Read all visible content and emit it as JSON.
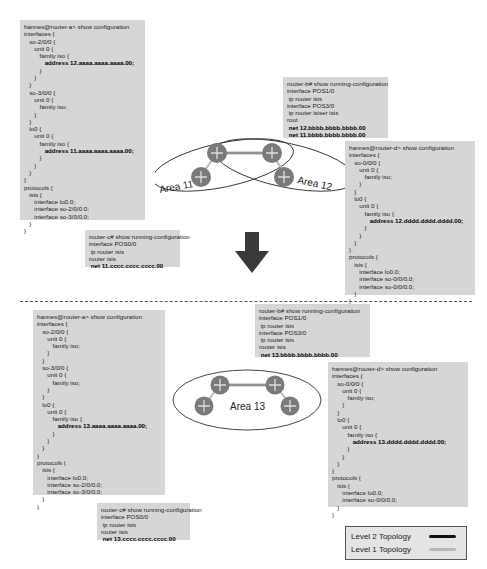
{
  "before": {
    "router_a": {
      "lines": [
        "hannes@router-a> show configuration",
        "interfaces {",
        "   so-2/0/0 {",
        "      unit 0 {",
        "         family iso {",
        "            address 12.aaaa.aaaa.aaaa.00;",
        "         }",
        "      }",
        "   }",
        "   so-3/0/0 {",
        "      unit 0 {",
        "         family iso;",
        "      }",
        "   }",
        "   lo0 {",
        "      unit 0 {",
        "         family iso {",
        "            address 11.aaaa.aaaa.aaaa.00;",
        "         }",
        "      }",
        "   }",
        "}",
        "protocols {",
        "   isis {",
        "      interface lo0.0;",
        "      interface so-2/0/0.0;",
        "      interface so-3/0/0.0;",
        "   }",
        "}"
      ],
      "bold_lines": [
        5,
        17
      ]
    },
    "router_b": {
      "lines": [
        "router-b# show running-configuration",
        "interface POS1/0",
        " ip router isis",
        "interface POS3/0",
        " ip router isiser isis",
        "rout",
        " net 12.bbbb.bbbb.bbbb.00",
        " net 11.bbbb.bbbb.bbbb.00"
      ],
      "bold_lines": [
        6,
        7
      ]
    },
    "router_c": {
      "lines": [
        "router-c# show running-configuration",
        "interface POS0/0",
        " ip router isis",
        "router isis",
        " net 11.cccc.cccc.cccc.00"
      ],
      "bold_lines": [
        4
      ]
    },
    "router_d": {
      "lines": [
        "hannes@router-d> show configuration",
        "interfaces {",
        "   so-0/0/0 {",
        "      unit 0 {",
        "         family iso;",
        "      }",
        "   }",
        "   lo0 {",
        "      unit 0 {",
        "         family iso {",
        "            address 12.dddd.dddd.dddd.00;",
        "         }",
        "      }",
        "   }",
        "}",
        "protocols {",
        "   isis {",
        "      interface lo0.0;",
        "      interface so-0/0/0.0;",
        "      interface so-0/0/0.0;",
        "   }",
        "}"
      ],
      "bold_lines": [
        10
      ]
    },
    "topology": {
      "area_left": "Area 11",
      "area_right": "Area 12"
    }
  },
  "after": {
    "router_a": {
      "lines": [
        "hannes@router-a> show configuration",
        "interfaces {",
        "   so-2/0/0 {",
        "      unit 0 {",
        "         family iso;",
        "      }",
        "   }",
        "   so-3/0/0 {",
        "      unit 0 {",
        "         family iso;",
        "      }",
        "   }",
        "   lo0 {",
        "      unit 0 {",
        "         family iso {",
        "            address 13.aaaa.aaaa.aaaa.00;",
        "         }",
        "      }",
        "   }",
        "}",
        "protocols {",
        "   isis {",
        "      interface lo0.0;",
        "      interface so-2/0/0.0;",
        "      interface so-3/0/0.0;",
        "   }",
        "}"
      ],
      "bold_lines": [
        15
      ]
    },
    "router_b": {
      "lines": [
        "router-b# show running-configuration",
        "interface POS1/0",
        " ip router isis",
        "interface POS3/0",
        " ip router isis",
        "router isis",
        " net 13.bbbb.bbbb.bbbb.00"
      ],
      "bold_lines": [
        6
      ]
    },
    "router_c": {
      "lines": [
        "router-c# show running-configuration",
        "interface POS0/0",
        " ip router isis",
        "router isis",
        " net 13.cccc.cccc.cccc.00"
      ],
      "bold_lines": [
        4
      ]
    },
    "router_d": {
      "lines": [
        "hannes@router-d> show configuration",
        "interfaces {",
        "   so-0/0/0 {",
        "      unit 0 {",
        "         family iso;",
        "      }",
        "   }",
        "   lo0 {",
        "      unit 0 {",
        "         family iso {",
        "            address 13.dddd.dddd.dddd.00;",
        "         }",
        "      }",
        "   }",
        "}",
        "protocols {",
        "   isis {",
        "      interface lo0.0;",
        "      interface so-0/0/0.0;",
        "   }",
        "}"
      ],
      "bold_lines": [
        10
      ]
    },
    "topology": {
      "area": "Area 13"
    }
  },
  "legend": {
    "items": [
      {
        "label": "Level 2 Topology",
        "color": "#111111"
      },
      {
        "label": "Level 1 Topology",
        "color": "#b8b8b8"
      }
    ]
  },
  "colors": {
    "config_bg": "#d6d6d6",
    "router_fill": "#7a7a7a",
    "arrow": "#3a3a3a"
  }
}
